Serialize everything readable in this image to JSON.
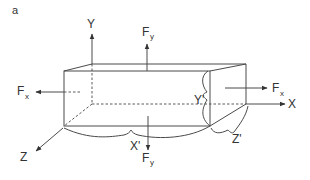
{
  "panel_label": "a",
  "axes": {
    "x": "X",
    "y": "Y",
    "z": "Z"
  },
  "forces": {
    "fx_right": {
      "main": "F",
      "sub": "x"
    },
    "fx_left": {
      "main": "F",
      "sub": "x"
    },
    "fy_up": {
      "main": "F",
      "sub": "y"
    },
    "fy_down": {
      "main": "F",
      "sub": "y"
    }
  },
  "dimensions": {
    "x_prime": "X'",
    "y_prime": "Y'",
    "z_prime": "Z'"
  },
  "colors": {
    "line": "#4a4a4a",
    "text": "#333333"
  }
}
